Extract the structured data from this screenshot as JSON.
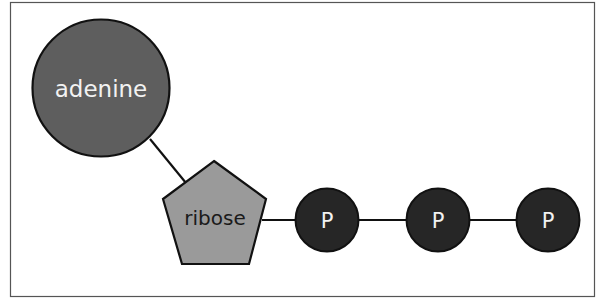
{
  "diagram": {
    "nodes": [
      {
        "id": "adenine",
        "label": "adenine",
        "shape": "circle",
        "fill": "#5e5e5e",
        "text_color": "#f2f2f2"
      },
      {
        "id": "ribose",
        "label": "ribose",
        "shape": "pentagon",
        "fill": "#9a9a9a",
        "text_color": "#1a1a1a"
      },
      {
        "id": "phosphate1",
        "label": "P",
        "shape": "circle",
        "fill": "#262626",
        "text_color": "#f2f2f2"
      },
      {
        "id": "phosphate2",
        "label": "P",
        "shape": "circle",
        "fill": "#262626",
        "text_color": "#f2f2f2"
      },
      {
        "id": "phosphate3",
        "label": "P",
        "shape": "circle",
        "fill": "#262626",
        "text_color": "#f2f2f2"
      }
    ],
    "edges": [
      {
        "from": "adenine",
        "to": "ribose"
      },
      {
        "from": "ribose",
        "to": "phosphate1"
      },
      {
        "from": "phosphate1",
        "to": "phosphate2"
      },
      {
        "from": "phosphate2",
        "to": "phosphate3"
      }
    ],
    "colors": {
      "frame": "#555555",
      "stroke": "#111111",
      "background": "#ffffff"
    }
  }
}
